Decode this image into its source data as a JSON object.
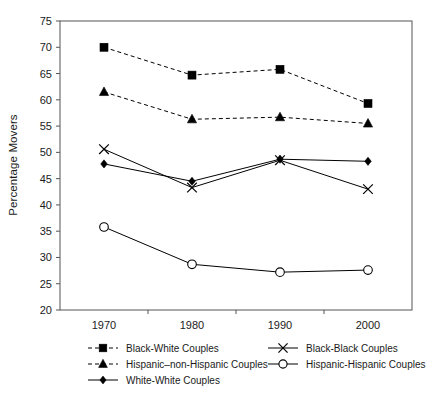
{
  "chart_data": {
    "type": "line",
    "title": "",
    "xlabel": "",
    "ylabel": "Percentage Movers",
    "categories": [
      "1970",
      "1980",
      "1990",
      "2000"
    ],
    "x": [
      1970,
      1980,
      1990,
      2000
    ],
    "xlim": [
      1965,
      2005
    ],
    "ylim": [
      20,
      75
    ],
    "yticks": [
      20,
      25,
      30,
      35,
      40,
      45,
      50,
      55,
      60,
      65,
      70,
      75
    ],
    "ytick_labels": [
      "20",
      "25",
      "30",
      "35",
      "40",
      "45",
      "50",
      "55",
      "60",
      "65",
      "70",
      "75"
    ],
    "grid": false,
    "legend_position": "below-plot",
    "series": [
      {
        "name": "Black-White Couples",
        "marker": "square",
        "line_style": "dashed",
        "values": [
          70.0,
          64.7,
          65.8,
          59.3
        ]
      },
      {
        "name": "Hispanic–non-Hispanic Couples",
        "marker": "triangle",
        "line_style": "dashed",
        "values": [
          61.5,
          56.3,
          56.7,
          55.5
        ]
      },
      {
        "name": "White-White Couples",
        "marker": "diamond",
        "line_style": "solid",
        "values": [
          47.8,
          44.5,
          48.7,
          48.3
        ]
      },
      {
        "name": "Black-Black Couples",
        "marker": "x",
        "line_style": "solid",
        "values": [
          50.6,
          43.3,
          48.5,
          43.0
        ]
      },
      {
        "name": "Hispanic-Hispanic Couples",
        "marker": "circle",
        "line_style": "solid",
        "values": [
          35.8,
          28.7,
          27.2,
          27.6
        ]
      }
    ]
  },
  "legend": {
    "entries": [
      {
        "label": "Black-White Couples",
        "marker": "square",
        "line_style": "dashed",
        "column": 0,
        "row": 0
      },
      {
        "label": "Hispanic–non-Hispanic Couples",
        "marker": "triangle",
        "line_style": "dashed",
        "column": 0,
        "row": 1
      },
      {
        "label": "White-White Couples",
        "marker": "diamond",
        "line_style": "solid",
        "column": 0,
        "row": 2
      },
      {
        "label": "Black-Black Couples",
        "marker": "x",
        "line_style": "solid",
        "column": 1,
        "row": 0
      },
      {
        "label": "Hispanic-Hispanic Couples",
        "marker": "circle",
        "line_style": "solid",
        "column": 1,
        "row": 1
      }
    ]
  },
  "colors": {
    "series": "#000000",
    "axis": "#555555",
    "background": "#ffffff",
    "text": "#1a1a1a"
  }
}
